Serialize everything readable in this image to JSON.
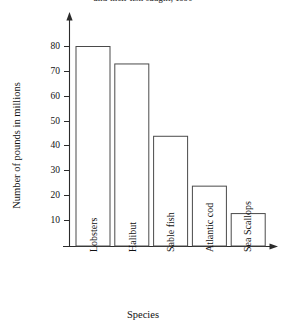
{
  "figure": {
    "caption": "and their fish caught, 1990"
  },
  "chart_data": {
    "type": "bar",
    "title": "",
    "xlabel": "Species",
    "ylabel": "Number of pounds in millions",
    "categories": [
      "Lobsters",
      "Halibut",
      "Sable fish",
      "Atlantic cod",
      "Sea Scallops"
    ],
    "values": [
      80,
      73,
      44,
      24,
      13
    ],
    "series": [
      {
        "name": "Number of pounds in millions",
        "values": [
          80,
          73,
          44,
          24,
          13
        ]
      }
    ],
    "ylim": [
      0,
      88
    ],
    "xlim": [
      0,
      5
    ],
    "y_ticks": [
      10,
      20,
      30,
      40,
      50,
      60,
      70,
      80
    ],
    "y_tick_labels": [
      "10",
      "20",
      "30",
      "40",
      "50",
      "60",
      "70",
      "80"
    ],
    "grid": false,
    "legend": false,
    "legend_position": "none",
    "bar_fill_color": "#ffffff",
    "bar_edge_color": "#4a4a4a",
    "axis_color": "#2b2b2b",
    "background_color": "#ffffff",
    "axis_arrows": true
  },
  "axes": {
    "y_title": "Number of pounds in millions",
    "x_title": "Species"
  },
  "colors": {
    "axis": "#2b2b2b",
    "bar_edge": "#4a4a4a",
    "bar_fill": "#ffffff",
    "text": "#111111",
    "background": "#ffffff"
  }
}
